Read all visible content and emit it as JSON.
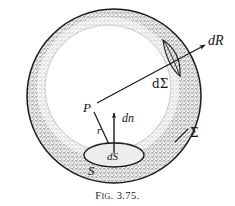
{
  "figure": {
    "caption": {
      "full": "FIG. 3.75.",
      "lead_letter": "F",
      "small_caps": "IG",
      "period_after_prefix": ".",
      "number": " 3.75."
    },
    "labels": {
      "point_p": "P",
      "radius_r": "r",
      "normal_dn": "dn",
      "element_ds": "dS",
      "surface_s": "S",
      "solid_angle_patch": "dΣ",
      "vector_dr": "dR",
      "surface_sigma": "Σ"
    },
    "colors": {
      "background": "#ffffff",
      "ink": "#141414",
      "line": "#1a1a1a",
      "stipple": "#4a4a4a",
      "shell_fill": "#cfcfcf",
      "hatch": "#2a2a2a",
      "ellipse_fill": "#ededed"
    },
    "geometry": {
      "outer_circle": {
        "cx": 114,
        "cy": 96,
        "r": 88,
        "label": "Sigma outer sphere boundary"
      },
      "inner_circle": {
        "cx": 108,
        "cy": 88,
        "r": 64,
        "label": "inner shell boundary"
      },
      "point_p": {
        "x": 92,
        "y": 107
      },
      "ds_ellipse": {
        "cx": 114,
        "cy": 155,
        "rx": 30,
        "ry": 12
      },
      "dn_arrow": {
        "x1": 114,
        "y1": 152,
        "x2": 114,
        "y2": 114
      },
      "r_line": {
        "x1": 94,
        "y1": 111,
        "x2": 113,
        "y2": 152
      },
      "dr_line": {
        "x1": 98,
        "y1": 103,
        "x2": 204,
        "y2": 46
      },
      "dsigma_patch": {
        "cx": 171,
        "cy": 62
      },
      "sigma_tick": {
        "x1": 176,
        "y1": 140,
        "x2": 187,
        "y2": 128
      }
    },
    "icons": {
      "arrowhead_dr": "arrow-head-icon",
      "arrowhead_dn": "arrow-head-icon",
      "arrowhead_r": "arrow-head-icon"
    }
  }
}
